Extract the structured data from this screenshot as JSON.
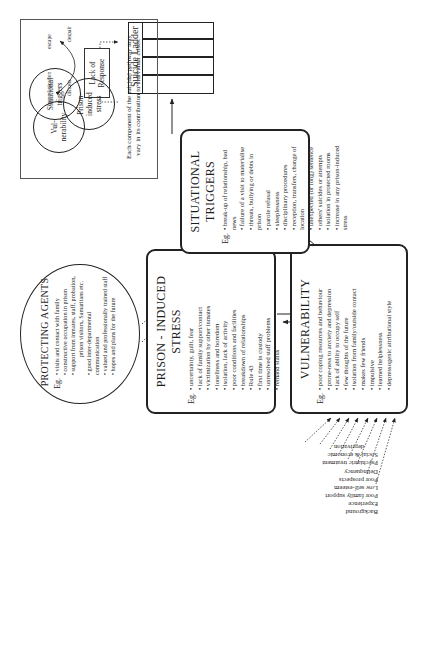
{
  "orientation": "rotated 90 degrees counter-clockwise",
  "factors": {
    "items": [
      "Background",
      "Experience",
      "Poor family support",
      "Low self-esteem",
      "Poor prospects",
      "Delinquency",
      "Psychiatric treatment",
      "Social & economic",
      "deprivation"
    ]
  },
  "vulnerability": {
    "title": "VULNERABILITY",
    "eg": "Eg.",
    "items": [
      "poor coping resources and behaviour",
      "prone-ness to anxiety and depression",
      "lack of ability to occupy self",
      "few thoughts of the future",
      "isolation from family/outside contact",
      "makes few friends",
      "impulsive",
      "learned helplessness",
      "depressogenic attributional style"
    ]
  },
  "prison_stress": {
    "title": "PRISON - INDUCED STRESS",
    "eg": "Eg.",
    "items": [
      "uncertainty, guilt, fear",
      "lack of family support/contact",
      "victimization by other inmates",
      "loneliness and boredom",
      "isolation, lack of activity",
      "poor conditions and facilities",
      "breakdown of relationships",
      "Rule 43",
      "first time in custody",
      "unresolved staff problems",
      "remand status"
    ]
  },
  "situational_triggers": {
    "title": "SITUATIONAL TRIGGERS",
    "eg": "Eg.",
    "items": [
      "break-up of relationship, bad news",
      "failure of a visit to materialise",
      "threats, bullying or debts in prison",
      "parole refusal",
      "sleeplessness",
      "disciplinary procedures",
      "reception, transfers, change of location",
      "unexpected (or long) sentence",
      "others' suicides or attempts",
      "isolation in protected rooms",
      "increase in any prison-induced stress"
    ]
  },
  "protecting_agents": {
    "title": "PROTECTING AGENTS",
    "eg": "Eg.",
    "items": [
      "visits and contact with family",
      "constructive occupation in prison",
      "support from inmates, staff, probation,",
      "prison visitors, Samaritans etc.",
      "good inter-departmental communication",
      "valued and professionally trained staff",
      "hopes and plans for the future"
    ]
  },
  "suicide_ladder": {
    "title": "Suicide Ladder",
    "labels": {
      "communication": "communication",
      "distress": "distress",
      "escape": "escape",
      "despair": "despair"
    },
    "lack_of_response": [
      "Lack of",
      "Response"
    ]
  },
  "legend": {
    "circles": [
      {
        "label": [
          "Vul-",
          "nerability"
        ]
      },
      {
        "label": [
          "Situational",
          "triggers"
        ]
      },
      {
        "label": [
          "Prison-",
          "induced",
          "stress"
        ]
      }
    ],
    "caption": [
      "Each component of the suicidal pathway may",
      "vary in its contribution to individual crises."
    ]
  }
}
